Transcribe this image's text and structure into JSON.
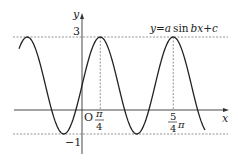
{
  "figure": {
    "equation_label": "y=a sin bx+c",
    "equation_parts": {
      "y": "y",
      "eq": "=",
      "a": "a",
      "sin": "sin",
      "b": "b",
      "x": "x",
      "plus": "+",
      "c": "c"
    },
    "axes": {
      "x_label": "x",
      "y_label": "y",
      "origin_label": "O"
    },
    "y_ticks": {
      "max": "3",
      "min": "−1"
    },
    "x_ticks": [
      {
        "num": "π",
        "den": "4"
      },
      {
        "num": "5",
        "den": "4",
        "suffix": "π"
      }
    ],
    "curve": {
      "amplitude": 2,
      "b": 2,
      "c": 1,
      "max": 3,
      "min": -1,
      "peaks_at": [
        "π/4",
        "5π/4"
      ]
    },
    "colors": {
      "curve": "#222222",
      "axis": "#333333",
      "guide": "#666666"
    }
  }
}
